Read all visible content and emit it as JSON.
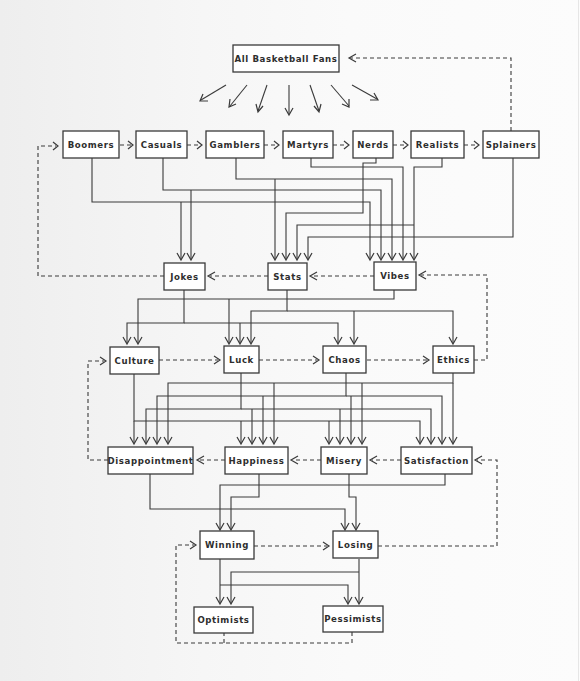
{
  "diagram": {
    "title": "All Basketball Fans",
    "colors": {
      "line": "#3a3a3a",
      "box_fill": "#ffffff",
      "text": "#2e2e2e",
      "background": "#f6f6f6"
    },
    "nodes": {
      "all_fans": "All Basketball Fans",
      "boomers": "Boomers",
      "casuals": "Casuals",
      "gamblers": "Gamblers",
      "martyrs": "Martyrs",
      "nerds": "Nerds",
      "realists": "Realists",
      "splainers": "Splainers",
      "jokes": "Jokes",
      "stats": "Stats",
      "vibes": "Vibes",
      "culture": "Culture",
      "luck": "Luck",
      "chaos": "Chaos",
      "ethics": "Ethics",
      "disappointment": "Disappointment",
      "happiness": "Happiness",
      "misery": "Misery",
      "satisfaction": "Satisfaction",
      "winning": "Winning",
      "losing": "Losing",
      "optimists": "Optimists",
      "pessimists": "Pessimists"
    },
    "rows": [
      [
        "All Basketball Fans"
      ],
      [
        "Boomers",
        "Casuals",
        "Gamblers",
        "Martyrs",
        "Nerds",
        "Realists",
        "Splainers"
      ],
      [
        "Jokes",
        "Stats",
        "Vibes"
      ],
      [
        "Culture",
        "Luck",
        "Chaos",
        "Ethics"
      ],
      [
        "Disappointment",
        "Happiness",
        "Misery",
        "Satisfaction"
      ],
      [
        "Winning",
        "Losing"
      ],
      [
        "Optimists",
        "Pessimists"
      ]
    ],
    "solid_edges": [
      [
        "Boomers",
        "Jokes"
      ],
      [
        "Boomers",
        "Vibes"
      ],
      [
        "Casuals",
        "Jokes"
      ],
      [
        "Casuals",
        "Vibes"
      ],
      [
        "Gamblers",
        "Stats"
      ],
      [
        "Gamblers",
        "Vibes"
      ],
      [
        "Martyrs",
        "Vibes"
      ],
      [
        "Nerds",
        "Stats"
      ],
      [
        "Nerds",
        "Vibes"
      ],
      [
        "Realists",
        "Stats"
      ],
      [
        "Realists",
        "Vibes"
      ],
      [
        "Splainers",
        "Stats"
      ],
      [
        "Jokes",
        "Culture"
      ],
      [
        "Jokes",
        "Chaos"
      ],
      [
        "Stats",
        "Luck"
      ],
      [
        "Stats",
        "Chaos"
      ],
      [
        "Stats",
        "Ethics"
      ],
      [
        "Vibes",
        "Culture"
      ],
      [
        "Vibes",
        "Luck"
      ],
      [
        "Culture",
        "Disappointment"
      ],
      [
        "Culture",
        "Satisfaction"
      ],
      [
        "Luck",
        "Happiness"
      ],
      [
        "Luck",
        "Disappointment"
      ],
      [
        "Chaos",
        "Misery"
      ],
      [
        "Chaos",
        "Happiness"
      ],
      [
        "Ethics",
        "Satisfaction"
      ],
      [
        "Ethics",
        "Disappointment"
      ],
      [
        "Disappointment",
        "Losing"
      ],
      [
        "Happiness",
        "Winning"
      ],
      [
        "Misery",
        "Losing"
      ],
      [
        "Satisfaction",
        "Winning"
      ],
      [
        "Winning",
        "Optimists"
      ],
      [
        "Winning",
        "Pessimists"
      ],
      [
        "Losing",
        "Optimists"
      ],
      [
        "Losing",
        "Pessimists"
      ]
    ],
    "dashed_edges": [
      [
        "Splainers",
        "All Basketball Fans"
      ],
      [
        "Boomers",
        "Casuals"
      ],
      [
        "Casuals",
        "Gamblers"
      ],
      [
        "Gamblers",
        "Martyrs"
      ],
      [
        "Martyrs",
        "Nerds"
      ],
      [
        "Nerds",
        "Realists"
      ],
      [
        "Realists",
        "Splainers"
      ],
      [
        "Jokes",
        "Boomers"
      ],
      [
        "Stats",
        "Jokes"
      ],
      [
        "Vibes",
        "Stats"
      ],
      [
        "Ethics",
        "Vibes"
      ],
      [
        "Culture",
        "Luck"
      ],
      [
        "Luck",
        "Chaos"
      ],
      [
        "Chaos",
        "Ethics"
      ],
      [
        "Disappointment",
        "Culture"
      ],
      [
        "Happiness",
        "Disappointment"
      ],
      [
        "Misery",
        "Happiness"
      ],
      [
        "Satisfaction",
        "Misery"
      ],
      [
        "Losing",
        "Satisfaction"
      ],
      [
        "Winning",
        "Losing"
      ],
      [
        "Optimists",
        "Winning"
      ],
      [
        "Pessimists",
        "Winning"
      ]
    ],
    "fanout_arrow_count": 7
  }
}
